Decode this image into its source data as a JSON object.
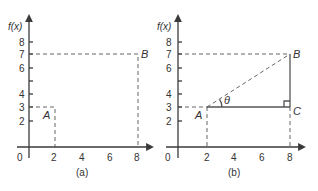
{
  "figure": {
    "panels": [
      {
        "id": "a",
        "caption": "(a)",
        "y_axis_label": "f(x)",
        "origin_label": "0",
        "x_ticks": [
          "2",
          "4",
          "6",
          "8"
        ],
        "y_ticks": [
          "8",
          "7",
          "6",
          "4",
          "3",
          "2"
        ],
        "points": [
          {
            "label": "A",
            "x": 2,
            "y": 3
          },
          {
            "label": "B",
            "x": 8,
            "y": 7
          }
        ]
      },
      {
        "id": "b",
        "caption": "(b)",
        "y_axis_label": "f(x)",
        "origin_label": "0",
        "x_ticks": [
          "2",
          "4",
          "6",
          "8"
        ],
        "y_ticks": [
          "8",
          "7",
          "6",
          "4",
          "3",
          "2"
        ],
        "points": [
          {
            "label": "A",
            "x": 2,
            "y": 3
          },
          {
            "label": "B",
            "x": 8,
            "y": 7
          },
          {
            "label": "C",
            "x": 8,
            "y": 3
          }
        ],
        "angle_label": "θ"
      }
    ]
  },
  "colors": {
    "axis": "#3a3a3a",
    "lines": "#555555",
    "text": "#333333",
    "background": "#ffffff"
  }
}
